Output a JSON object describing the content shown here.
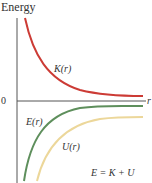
{
  "diagram": {
    "y_axis_label": "Energy",
    "x_axis_label": "r",
    "zero_label": "0",
    "curves": [
      {
        "name": "K(r)",
        "label": "K(r)",
        "color": "#cc3b35",
        "description": "kinetic energy, positive, decreasing toward 0"
      },
      {
        "name": "E(r)",
        "label": "E(r)",
        "color": "#5e8f5c",
        "description": "total energy, negative, rising toward 0"
      },
      {
        "name": "U(r)",
        "label": "U(r)",
        "color": "#ecd79a",
        "description": "potential energy, negative, rising toward 0"
      }
    ],
    "equation": "E = K + U"
  },
  "colors": {
    "axis": "#555555",
    "k_curve": "#cc3b35",
    "e_curve": "#5e8f5c",
    "u_curve": "#ecd79a"
  }
}
